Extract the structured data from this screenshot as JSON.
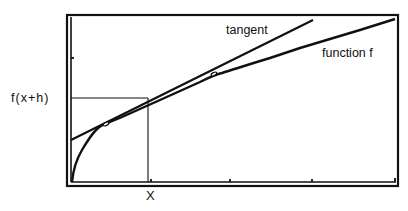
{
  "diagram": {
    "title": "",
    "labels": {
      "y_value": "f(x+h)",
      "x_value": "X",
      "tangent": "tangent",
      "function": "function f"
    },
    "colors": {
      "ink": "#111111",
      "background": "#ffffff"
    },
    "elements": {
      "frame": {
        "x1": 67,
        "y1": 15,
        "x2": 398,
        "y2": 186
      },
      "tangent_line": {
        "from": [
          72,
          140
        ],
        "to": [
          313,
          20
        ]
      },
      "function_curve_points": [
        [
          72,
          182
        ],
        [
          74,
          170
        ],
        [
          78,
          158
        ],
        [
          84,
          146
        ],
        [
          92,
          136
        ],
        [
          100,
          128
        ],
        [
          108,
          124
        ],
        [
          130,
          113
        ],
        [
          160,
          100
        ],
        [
          190,
          87
        ],
        [
          215,
          75
        ],
        [
          240,
          67
        ],
        [
          270,
          58
        ],
        [
          300,
          48
        ],
        [
          330,
          39
        ],
        [
          360,
          30
        ],
        [
          395,
          19
        ]
      ],
      "guide_box": {
        "x_left": 72,
        "y_level": 98,
        "x_level": 148,
        "y_bottom": 184
      },
      "x_ticks": [
        150,
        230,
        312,
        395
      ],
      "y_ticks": [
        58
      ]
    }
  }
}
